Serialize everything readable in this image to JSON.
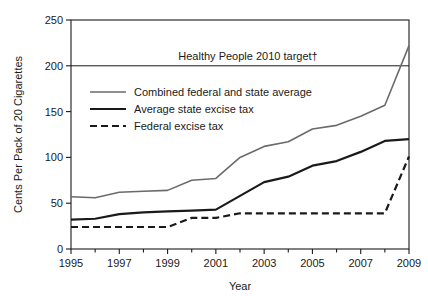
{
  "chart_data": {
    "type": "line",
    "title": "",
    "xlabel": "Year",
    "ylabel": "Cents Per Pack of 20 Cigarettes",
    "xlim": [
      1995,
      2009
    ],
    "ylim": [
      0,
      250
    ],
    "grid": false,
    "legend_position": "upper-left-inside",
    "x": [
      1995,
      1996,
      1997,
      1998,
      1999,
      2000,
      2001,
      2002,
      2003,
      2004,
      2005,
      2006,
      2007,
      2008,
      2009
    ],
    "xticks": [
      1995,
      1997,
      1999,
      2001,
      2003,
      2005,
      2007,
      2009
    ],
    "xtick_labels": [
      "1995",
      "1997",
      "1999",
      "2001",
      "2003",
      "2005",
      "2007",
      "2009"
    ],
    "yticks": [
      0,
      50,
      100,
      150,
      200,
      250
    ],
    "ytick_labels": [
      "0",
      "50",
      "100",
      "150",
      "200",
      "250"
    ],
    "series": [
      {
        "name": "Combined federal and state average",
        "style": "solid",
        "color": "#6b6b6b",
        "width": 1.6,
        "values": [
          57,
          56,
          62,
          63,
          64,
          75,
          77,
          100,
          112,
          117,
          131,
          135,
          145,
          157,
          222
        ]
      },
      {
        "name": "Average state excise tax",
        "style": "solid",
        "color": "#1a1a1a",
        "width": 2.2,
        "values": [
          32,
          33,
          38,
          40,
          41,
          42,
          43,
          58,
          73,
          79,
          91,
          96,
          106,
          118,
          120
        ]
      },
      {
        "name": "Federal excise tax",
        "style": "dashed",
        "color": "#1a1a1a",
        "width": 2.2,
        "values": [
          24,
          24,
          24,
          24,
          24,
          34,
          34,
          39,
          39,
          39,
          39,
          39,
          39,
          39,
          101
        ]
      }
    ],
    "annotations": [
      {
        "type": "hline",
        "label": "Healthy People 2010 target†",
        "value": 200,
        "color": "#1a1a1a"
      }
    ]
  },
  "legend": {
    "items": [
      {
        "label": "Combined federal and state average"
      },
      {
        "label": "Average state excise tax"
      },
      {
        "label": "Federal excise tax"
      }
    ]
  },
  "axes": {
    "x_title": "Year",
    "y_title": "Cents Per Pack of 20 Cigarettes"
  }
}
